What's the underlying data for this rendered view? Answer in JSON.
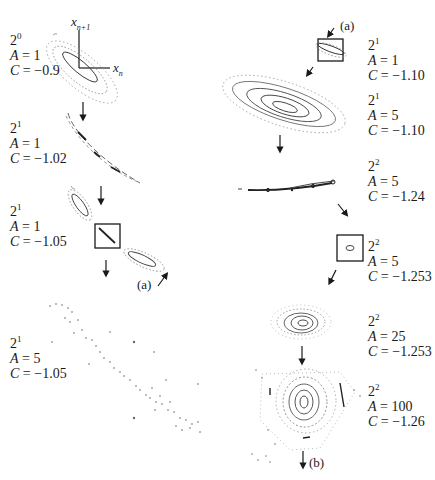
{
  "figure": {
    "axes": {
      "x_label_base": "x",
      "x_label_sub": "n",
      "y_label_base": "x",
      "y_label_sub": "n+1"
    },
    "panels": [
      {
        "id": "left-1",
        "period_base": "2",
        "period_exp": "0",
        "A_label": "A",
        "A_value": "= 1",
        "C_label": "C",
        "C_value": "= −0.9"
      },
      {
        "id": "left-2",
        "period_base": "2",
        "period_exp": "1",
        "A_label": "A",
        "A_value": "= 1",
        "C_label": "C",
        "C_value": "= −1.02"
      },
      {
        "id": "left-3",
        "period_base": "2",
        "period_exp": "1",
        "A_label": "A",
        "A_value": "= 1",
        "C_label": "C",
        "C_value": "= −1.05"
      },
      {
        "id": "left-4",
        "period_base": "2",
        "period_exp": "1",
        "A_label": "A",
        "A_value": "= 5",
        "C_label": "C",
        "C_value": "= −1.05"
      },
      {
        "id": "right-1",
        "period_base": "2",
        "period_exp": "1",
        "A_label": "A",
        "A_value": "= 1",
        "C_label": "C",
        "C_value": "= −1.10"
      },
      {
        "id": "right-2",
        "period_base": "2",
        "period_exp": "1",
        "A_label": "A",
        "A_value": "= 5",
        "C_label": "C",
        "C_value": "= −1.10"
      },
      {
        "id": "right-3",
        "period_base": "2",
        "period_exp": "2",
        "A_label": "A",
        "A_value": "= 5",
        "C_label": "C",
        "C_value": "= −1.24"
      },
      {
        "id": "right-4",
        "period_base": "2",
        "period_exp": "2",
        "A_label": "A",
        "A_value": "= 5",
        "C_label": "C",
        "C_value": "= −1.253"
      },
      {
        "id": "right-5",
        "period_base": "2",
        "period_exp": "2",
        "A_label": "A",
        "A_value": "= 25",
        "C_label": "C",
        "C_value": "= −1.253"
      },
      {
        "id": "right-6",
        "period_base": "2",
        "period_exp": "2",
        "A_label": "A",
        "A_value": "= 100",
        "C_label": "C",
        "C_value": "= −1.26"
      }
    ],
    "tags": {
      "a_left": "(a)",
      "a_right": "(a)",
      "b": "(b)"
    }
  },
  "colors": {
    "ink": "#1a1a1a",
    "dots": "#777777",
    "background": "#ffffff"
  }
}
